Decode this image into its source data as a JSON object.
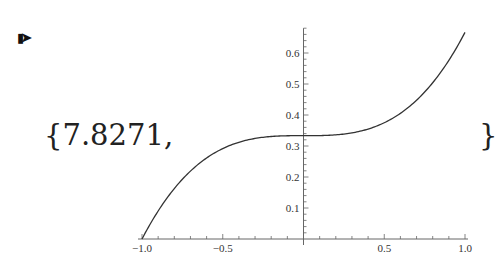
{
  "output": {
    "prompt_icon": "output-arrow-icon",
    "open_text": "{7.8271,",
    "close_text": "}"
  },
  "chart_data": {
    "type": "line",
    "title": "",
    "xlabel": "",
    "ylabel": "",
    "function": "(x^3 + 1)/3",
    "x": [
      -1.0,
      -0.9,
      -0.8,
      -0.7,
      -0.6,
      -0.5,
      -0.4,
      -0.3,
      -0.2,
      -0.1,
      0.0,
      0.1,
      0.2,
      0.3,
      0.4,
      0.5,
      0.6,
      0.7,
      0.8,
      0.9,
      1.0
    ],
    "series": [
      {
        "name": "f(x)",
        "values": [
          0.0,
          0.09,
          0.163,
          0.219,
          0.261,
          0.292,
          0.312,
          0.324,
          0.331,
          0.333,
          0.333,
          0.334,
          0.336,
          0.342,
          0.355,
          0.375,
          0.405,
          0.448,
          0.504,
          0.576,
          0.667
        ]
      }
    ],
    "xlim": [
      -1.0,
      1.0
    ],
    "ylim": [
      0.0,
      0.68
    ],
    "x_tick_labels": [
      "-1.0",
      "-0.5",
      "0.5",
      "1.0"
    ],
    "y_tick_labels": [
      "0.1",
      "0.2",
      "0.3",
      "0.4",
      "0.5",
      "0.6"
    ],
    "grid": false,
    "legend": "none",
    "axes_origin": [
      0,
      0
    ]
  }
}
